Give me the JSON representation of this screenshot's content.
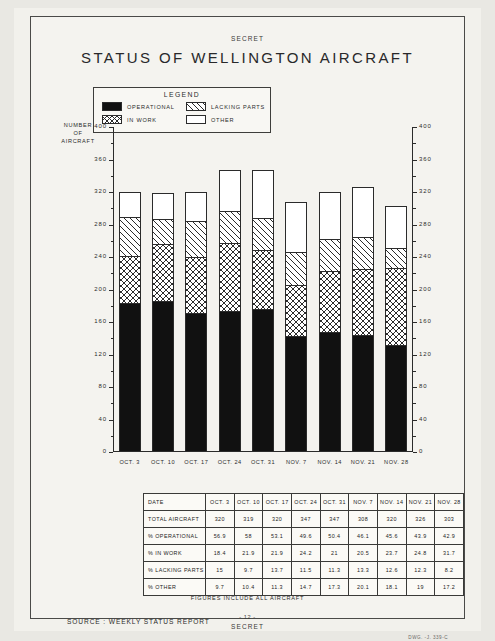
{
  "document": {
    "classification_top": "SECRET",
    "classification_bottom": "SECRET",
    "title": "STATUS OF WELLINGTON AIRCRAFT",
    "page_number": "- 12 -",
    "source_line": "SOURCE : WEEKLY STATUS REPORT",
    "figures_note": "FIGURES INCLUDE ALL AIRCRAFT",
    "drawing_number": "DWG. -J. 339-C"
  },
  "legend": {
    "title": "LEGEND",
    "items": [
      {
        "label": "OPERATIONAL",
        "swatch": "solid-black-swatch",
        "color": "#111111"
      },
      {
        "label": "LACKING PARTS",
        "swatch": "diagonal-hatch-swatch",
        "color": "#ffffff"
      },
      {
        "label": "IN WORK",
        "swatch": "cross-hatch-swatch",
        "color": "#ffffff"
      },
      {
        "label": "OTHER",
        "swatch": "empty-white-swatch",
        "color": "#ffffff"
      }
    ]
  },
  "chart_data": {
    "type": "bar",
    "stacked": true,
    "title": "STATUS OF WELLINGTON AIRCRAFT",
    "xlabel": "",
    "ylabel": "NUMBER OF AIRCRAFT",
    "ylim": [
      0,
      400
    ],
    "ytick_step": 40,
    "yminor_step": 20,
    "grid": false,
    "legend_position": "top-left-inset",
    "dual_axis": true,
    "categories": [
      "OCT. 3",
      "OCT. 10",
      "OCT. 17",
      "OCT. 24",
      "OCT. 31",
      "NOV. 7",
      "NOV. 14",
      "NOV. 21",
      "NOV. 28"
    ],
    "ytick_labels": [
      "0",
      "40",
      "80",
      "120",
      "160",
      "200",
      "240",
      "280",
      "320",
      "360",
      "400"
    ],
    "totals": [
      320,
      319,
      320,
      347,
      347,
      308,
      320,
      326,
      303
    ],
    "series": [
      {
        "name": "OPERATIONAL",
        "stack_order": 1,
        "values": [
          182,
          185,
          170,
          172,
          175,
          142,
          146,
          143,
          130
        ]
      },
      {
        "name": "IN WORK",
        "stack_order": 2,
        "values": [
          59,
          70,
          70,
          84,
          73,
          63,
          76,
          81,
          96
        ]
      },
      {
        "name": "LACKING PARTS",
        "stack_order": 3,
        "values": [
          48,
          31,
          44,
          40,
          39,
          41,
          40,
          40,
          25
        ]
      },
      {
        "name": "OTHER",
        "stack_order": 4,
        "values": [
          31,
          33,
          36,
          51,
          60,
          62,
          58,
          62,
          52
        ]
      }
    ]
  },
  "table": {
    "columns": [
      "DATE",
      "OCT. 3",
      "OCT. 10",
      "OCT. 17",
      "OCT. 24",
      "OCT. 31",
      "NOV. 7",
      "NOV. 14",
      "NOV. 21",
      "NOV. 28"
    ],
    "rows": [
      {
        "label": "TOTAL AIRCRAFT",
        "values": [
          "320",
          "319",
          "320",
          "347",
          "347",
          "308",
          "320",
          "326",
          "303"
        ]
      },
      {
        "label": "% OPERATIONAL",
        "values": [
          "56.9",
          "58",
          "53.1",
          "49.6",
          "50.4",
          "46.1",
          "45.6",
          "43.9",
          "42.9"
        ]
      },
      {
        "label": "% IN WORK",
        "values": [
          "18.4",
          "21.9",
          "21.9",
          "24.2",
          "21",
          "20.5",
          "23.7",
          "24.8",
          "31.7"
        ]
      },
      {
        "label": "% LACKING PARTS",
        "values": [
          "15",
          "9.7",
          "13.7",
          "11.5",
          "11.3",
          "13.3",
          "12.6",
          "12.3",
          "8.2"
        ]
      },
      {
        "label": "% OTHER",
        "values": [
          "9.7",
          "10.4",
          "11.3",
          "14.7",
          "17.3",
          "20.1",
          "18.1",
          "19",
          "17.2"
        ]
      }
    ]
  }
}
